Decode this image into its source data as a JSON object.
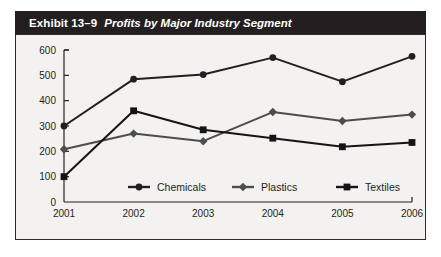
{
  "exhibit": {
    "label": "Exhibit 13–9",
    "caption": "Profits by Major Industry Segment"
  },
  "colors": {
    "title_bar_bg": "#231f20",
    "title_text": "#ffffff",
    "chart_bg": "#f3f2f0",
    "frame_border": "#2f2b2a",
    "chemicals": "#231f20",
    "plastics": "#4d4d4d",
    "textiles": "#161314",
    "axis": "#231f20",
    "page_bg": "#ffffff"
  },
  "chart_data": {
    "type": "line",
    "title": "Profits by Major Industry Segment",
    "xlabel": "",
    "ylabel": "",
    "categories": [
      "2001",
      "2002",
      "2003",
      "2004",
      "2005",
      "2006"
    ],
    "ylim": [
      0,
      600
    ],
    "yticks": [
      0,
      100,
      200,
      300,
      400,
      500,
      600
    ],
    "ytick_labels": [
      "0",
      "100",
      "200",
      "300",
      "400",
      "500",
      "600"
    ],
    "grid": false,
    "legend_position": "bottom-inside",
    "series": [
      {
        "name": "Chemicals",
        "marker": "circle",
        "color": "#231f20",
        "values": [
          300,
          485,
          503,
          570,
          475,
          575
        ]
      },
      {
        "name": "Plastics",
        "marker": "diamond",
        "color": "#4d4d4d",
        "values": [
          208,
          270,
          240,
          355,
          320,
          345
        ]
      },
      {
        "name": "Textiles",
        "marker": "square",
        "color": "#161314",
        "values": [
          100,
          360,
          285,
          252,
          218,
          235
        ]
      }
    ]
  }
}
